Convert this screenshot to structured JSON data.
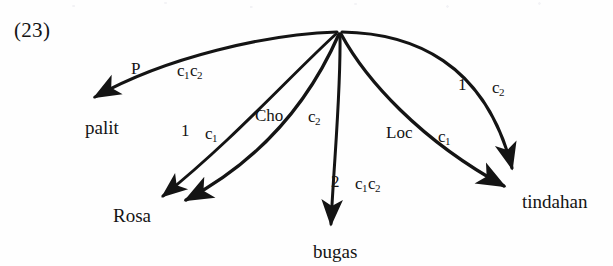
{
  "example": {
    "number": "(23)"
  },
  "diagram": {
    "type": "radial-dependency-arrows",
    "apex": {
      "x": 338,
      "y": 32
    },
    "ink_color": "#141414",
    "background_color": "#fefefe",
    "nodes": [
      {
        "id": "palit",
        "label": "palit",
        "x": 85,
        "y": 129
      },
      {
        "id": "rosa",
        "label": "Rosa",
        "x": 113,
        "y": 217
      },
      {
        "id": "bugas",
        "label": "bugas",
        "x": 313,
        "y": 253
      },
      {
        "id": "tindahan",
        "label": "tindahan",
        "x": 522,
        "y": 203
      }
    ],
    "edges": [
      {
        "id": "edge-palit",
        "target": "palit",
        "role": "P",
        "index": "c1c2",
        "index_parts": [
          "c",
          "1",
          "c",
          "2"
        ],
        "shape": "curve-arc-left"
      },
      {
        "id": "edge-rosa-1",
        "target": "rosa",
        "role": "1",
        "index": "c1",
        "index_parts": [
          "c",
          "1"
        ],
        "shape": "straight"
      },
      {
        "id": "edge-rosa-cho",
        "target": "rosa",
        "role": "Cho",
        "index": "c2",
        "index_parts": [
          "c",
          "2"
        ],
        "shape": "curve-sweep-left"
      },
      {
        "id": "edge-bugas",
        "target": "bugas",
        "role": "2",
        "index": "c1c2",
        "index_parts": [
          "c",
          "1",
          "c",
          "2"
        ],
        "shape": "near-vertical"
      },
      {
        "id": "edge-tindahan-loc",
        "target": "tindahan",
        "role": "Loc",
        "index": "c1",
        "index_parts": [
          "c",
          "1"
        ],
        "shape": "curve-sweep-right"
      },
      {
        "id": "edge-tindahan-1",
        "target": "tindahan",
        "role": "1",
        "index": "c2",
        "index_parts": [
          "c",
          "2"
        ],
        "shape": "curve-arc-right"
      }
    ],
    "edge_labels": [
      {
        "id": "lbl-P",
        "text": "P",
        "x": 131,
        "y": 66,
        "sub": null
      },
      {
        "id": "lbl-c1c2-left",
        "text": "c",
        "x": 177,
        "y": 68,
        "sub": "1",
        "text2": "c",
        "sub2": "2"
      },
      {
        "id": "lbl-1-rosa",
        "text": "1",
        "x": 181,
        "y": 128,
        "sub": null
      },
      {
        "id": "lbl-c1-rosa",
        "text": "c",
        "x": 205,
        "y": 131,
        "sub": "1"
      },
      {
        "id": "lbl-Cho",
        "text": "Cho",
        "x": 255,
        "y": 113,
        "sub": null
      },
      {
        "id": "lbl-c2-cho",
        "text": "c",
        "x": 308,
        "y": 114,
        "sub": "2"
      },
      {
        "id": "lbl-2-bugas",
        "text": "2",
        "x": 331,
        "y": 179,
        "sub": null
      },
      {
        "id": "lbl-c1c2-bugas",
        "text": "c",
        "x": 355,
        "y": 181,
        "sub": "1",
        "text2": "c",
        "sub2": "2"
      },
      {
        "id": "lbl-Loc",
        "text": "Loc",
        "x": 386,
        "y": 130,
        "sub": null
      },
      {
        "id": "lbl-c1-loc",
        "text": "c",
        "x": 438,
        "y": 134,
        "sub": "1"
      },
      {
        "id": "lbl-1-tind",
        "text": "1",
        "x": 458,
        "y": 82,
        "sub": null
      },
      {
        "id": "lbl-c2-tind",
        "text": "c",
        "x": 492,
        "y": 85,
        "sub": "2"
      }
    ]
  }
}
